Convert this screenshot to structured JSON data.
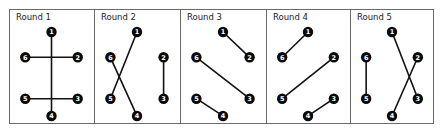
{
  "diagram": {
    "colors": {
      "border": "#6a6a6a",
      "edge": "#111111",
      "node_fill": "#0a0a0a",
      "node_text": "#ffffff",
      "title": "#222222"
    },
    "node_positions": {
      "1": [
        0.5,
        0.2
      ],
      "2": [
        0.88,
        0.42
      ],
      "3": [
        0.88,
        0.78
      ],
      "4": [
        0.5,
        0.93
      ],
      "5": [
        0.12,
        0.78
      ],
      "6": [
        0.12,
        0.42
      ]
    },
    "rounds": [
      {
        "title": "Round 1",
        "pairs": [
          [
            1,
            4
          ],
          [
            6,
            2
          ],
          [
            5,
            3
          ]
        ]
      },
      {
        "title": "Round 2",
        "pairs": [
          [
            1,
            5
          ],
          [
            6,
            4
          ],
          [
            2,
            3
          ]
        ]
      },
      {
        "title": "Round 3",
        "pairs": [
          [
            1,
            2
          ],
          [
            6,
            3
          ],
          [
            5,
            4
          ]
        ]
      },
      {
        "title": "Round 4",
        "pairs": [
          [
            1,
            6
          ],
          [
            5,
            2
          ],
          [
            4,
            3
          ]
        ]
      },
      {
        "title": "Round 5",
        "pairs": [
          [
            6,
            5
          ],
          [
            1,
            3
          ],
          [
            2,
            4
          ]
        ]
      }
    ]
  }
}
